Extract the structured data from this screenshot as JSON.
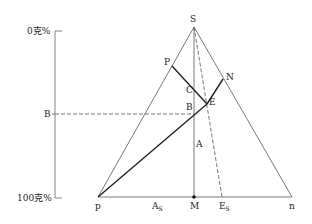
{
  "diagram": {
    "type": "ternary-phase-diagram",
    "axis": {
      "top_label": "0克%",
      "mid_label": "B",
      "bottom_label": "100克%"
    },
    "vertices": {
      "apex": "S",
      "left": "p",
      "right": "n"
    },
    "points": {
      "P": "P",
      "N": "N",
      "C": "C",
      "E": "E",
      "B": "B",
      "A": "A",
      "M": "M"
    },
    "base_labels": {
      "As_main": "A",
      "As_sub": "S",
      "M": "M",
      "Es_main": "E",
      "Es_sub": "S",
      "n": "n",
      "p": "p"
    },
    "colors": {
      "line": "#555555",
      "bold_line": "#222222",
      "text": "#222222"
    }
  }
}
